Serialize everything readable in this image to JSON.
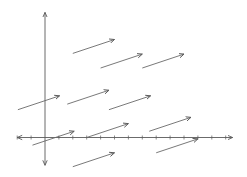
{
  "diagram": {
    "type": "vector-field-translation",
    "colors": {
      "axis": "#5a5a5a",
      "vector": "#6a6a6a",
      "background": "#ffffff"
    },
    "axes": {
      "x_range": [
        -2,
        13.5
      ],
      "y_range": [
        -2,
        9
      ],
      "tick_spacing": 1,
      "x_ticks": [
        -2,
        -1,
        1,
        2,
        3,
        4,
        5,
        6,
        7,
        8,
        9,
        10,
        11,
        12,
        13
      ],
      "arrows_both_ends": true
    },
    "vector_displacement": [
      3,
      1
    ],
    "vectors": [
      {
        "start": [
          2,
          6.05
        ]
      },
      {
        "start": [
          4,
          5
        ]
      },
      {
        "start": [
          7,
          5
        ]
      },
      {
        "start": [
          -1.95,
          2
        ]
      },
      {
        "start": [
          1.6,
          2.4
        ]
      },
      {
        "start": [
          4.6,
          2
        ]
      },
      {
        "start": [
          -0.9,
          -0.55
        ]
      },
      {
        "start": [
          3,
          0
        ]
      },
      {
        "start": [
          7.5,
          0.45
        ]
      },
      {
        "start": [
          8,
          -1.1
        ]
      },
      {
        "start": [
          2,
          -2.1
        ]
      }
    ]
  }
}
